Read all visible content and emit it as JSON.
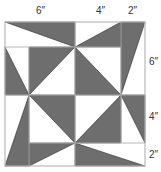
{
  "diagram": {
    "type": "quilt-block",
    "colors": {
      "dark": "#6e6e6e",
      "light": "#ffffff",
      "grid": "#b8b8b8",
      "edge": "#2a2a2a"
    },
    "grid_x": [
      5,
      29,
      75,
      121,
      145
    ],
    "grid_y": [
      22,
      47,
      95,
      143,
      166
    ],
    "top_labels": [
      {
        "text": "6″",
        "x": 36,
        "y": 6
      },
      {
        "text": "4″",
        "x": 96,
        "y": 6
      },
      {
        "text": "2″",
        "x": 128,
        "y": 6
      }
    ],
    "right_labels": [
      {
        "text": "6″",
        "x": 149,
        "y": 57
      },
      {
        "text": "4″",
        "x": 149,
        "y": 112
      },
      {
        "text": "2″",
        "x": 149,
        "y": 150
      }
    ],
    "dark_triangles": [
      [
        [
          5,
          22
        ],
        [
          75,
          22
        ],
        [
          75,
          47
        ]
      ],
      [
        [
          75,
          47
        ],
        [
          121,
          22
        ],
        [
          121,
          47
        ]
      ],
      [
        [
          121,
          22
        ],
        [
          145,
          22
        ],
        [
          121,
          95
        ]
      ],
      [
        [
          5,
          47
        ],
        [
          29,
          95
        ],
        [
          5,
          95
        ]
      ],
      [
        [
          29,
          47
        ],
        [
          75,
          47
        ],
        [
          29,
          95
        ]
      ],
      [
        [
          75,
          47
        ],
        [
          121,
          95
        ],
        [
          75,
          95
        ]
      ],
      [
        [
          29,
          95
        ],
        [
          5,
          166
        ],
        [
          29,
          166
        ]
      ],
      [
        [
          29,
          95
        ],
        [
          75,
          95
        ],
        [
          75,
          143
        ]
      ],
      [
        [
          75,
          143
        ],
        [
          121,
          95
        ],
        [
          121,
          143
        ]
      ],
      [
        [
          121,
          95
        ],
        [
          145,
          95
        ],
        [
          145,
          143
        ]
      ],
      [
        [
          29,
          143
        ],
        [
          75,
          143
        ],
        [
          29,
          166
        ]
      ],
      [
        [
          75,
          143
        ],
        [
          75,
          166
        ],
        [
          145,
          166
        ]
      ]
    ]
  }
}
